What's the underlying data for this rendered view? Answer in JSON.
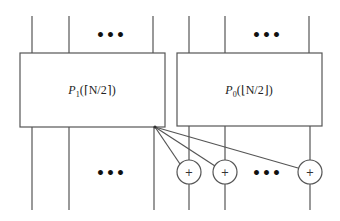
{
  "diagram": {
    "boxes": [
      {
        "id": "p1",
        "label": "P1(⌈N/2⌉)",
        "label_sym": "P",
        "label_sub": "1",
        "label_arg": "(⌈N/2⌉)"
      },
      {
        "id": "p0",
        "label": "P0(⌊N/2⌋)",
        "label_sym": "P",
        "label_sub": "0",
        "label_arg": "(⌊N/2⌋)"
      }
    ],
    "ellipsis": "•••",
    "adder_symbol": "+",
    "adders_count_visible": 3,
    "colors": {
      "stroke": "#555555",
      "text": "#222222",
      "background": "#ffffff"
    }
  }
}
